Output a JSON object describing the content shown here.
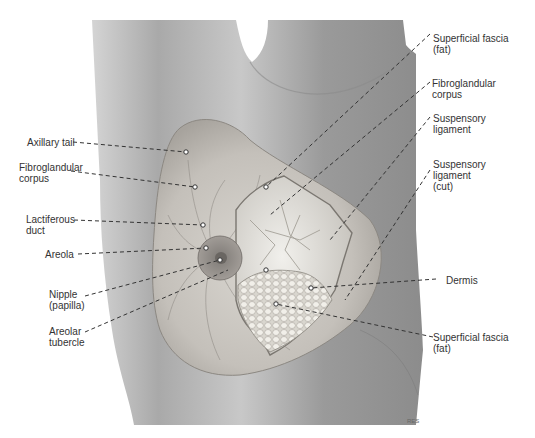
{
  "figure": {
    "type": "anatomical-illustration",
    "colors": {
      "skin_dark": "#8a8a8a",
      "skin_mid": "#b5b5b5",
      "skin_light": "#d8d8d8",
      "line": "#333333",
      "label_text": "#333333"
    }
  },
  "labels_left": [
    {
      "id": "axillary-tail",
      "text": "Axillary tail",
      "x": 27,
      "y": 139,
      "point": [
        186,
        152
      ]
    },
    {
      "id": "fibroglandular-corpus-left",
      "text": "Fibroglandular\ncorpus",
      "x": 19,
      "y": 164,
      "point": [
        195,
        187
      ]
    },
    {
      "id": "lactiferous-duct",
      "text": "Lactiferous\nduct",
      "x": 26,
      "y": 216,
      "point": [
        203,
        225
      ]
    },
    {
      "id": "areola",
      "text": "Areola",
      "x": 45,
      "y": 250,
      "point": [
        206,
        248
      ]
    },
    {
      "id": "nipple",
      "text": "Nipple\n(papilla)",
      "x": 49,
      "y": 290,
      "point": [
        220,
        260
      ]
    },
    {
      "id": "areolar-tubercle",
      "text": "Areolar\ntubercle",
      "x": 49,
      "y": 327,
      "point": [
        228,
        270
      ]
    }
  ],
  "labels_right": [
    {
      "id": "superficial-fascia-top",
      "text": "Superficial fascia\n(fat)",
      "x": 433,
      "y": 34,
      "point": [
        266,
        187
      ]
    },
    {
      "id": "fibroglandular-corpus-right",
      "text": "Fibroglandular\ncorpus",
      "x": 432,
      "y": 79,
      "point": [
        270,
        215
      ]
    },
    {
      "id": "suspensory-ligament",
      "text": "Suspensory\nligament",
      "x": 433,
      "y": 114,
      "point": [
        330,
        240
      ]
    },
    {
      "id": "suspensory-ligament-cut",
      "text": "Suspensory\nligament\n(cut)",
      "x": 433,
      "y": 160,
      "point": [
        345,
        300
      ]
    },
    {
      "id": "dermis",
      "text": "Dermis",
      "x": 446,
      "y": 276,
      "point": [
        311,
        288
      ]
    },
    {
      "id": "superficial-fascia-bottom",
      "text": "Superficial fascia\n(fat)",
      "x": 433,
      "y": 333,
      "point": [
        276,
        304
      ]
    }
  ],
  "signature": "RES"
}
